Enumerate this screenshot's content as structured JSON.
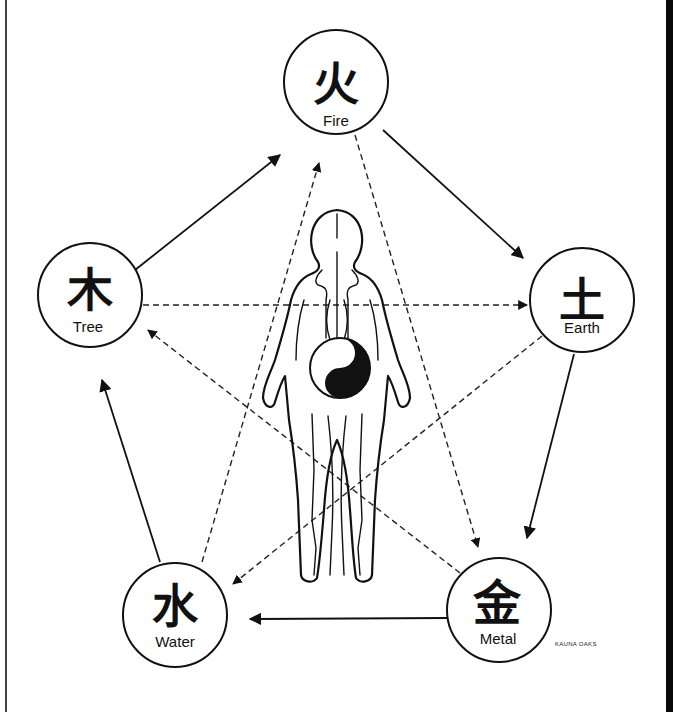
{
  "diagram": {
    "nodes": [
      {
        "id": "fire",
        "glyph": "火",
        "label": "Fire",
        "cx": 336,
        "cy": 82,
        "r": 52
      },
      {
        "id": "earth",
        "glyph": "土",
        "label": "Earth",
        "cx": 582,
        "cy": 300,
        "r": 52
      },
      {
        "id": "metal",
        "glyph": "金",
        "label": "Metal",
        "cx": 499,
        "cy": 610,
        "r": 52
      },
      {
        "id": "water",
        "glyph": "水",
        "label": "Water",
        "cx": 175,
        "cy": 615,
        "r": 52
      },
      {
        "id": "tree",
        "glyph": "木",
        "label": "Tree",
        "cx": 90,
        "cy": 295,
        "r": 52
      }
    ],
    "generating_cycle": [
      {
        "from": "tree",
        "to": "fire",
        "style": "solid"
      },
      {
        "from": "fire",
        "to": "earth",
        "style": "solid"
      },
      {
        "from": "earth",
        "to": "metal",
        "style": "solid"
      },
      {
        "from": "metal",
        "to": "water",
        "style": "solid"
      },
      {
        "from": "water",
        "to": "tree",
        "style": "solid"
      }
    ],
    "controlling_cycle": [
      {
        "from": "tree",
        "to": "earth",
        "style": "dashed"
      },
      {
        "from": "earth",
        "to": "water",
        "style": "dashed"
      },
      {
        "from": "water",
        "to": "fire",
        "style": "dashed"
      },
      {
        "from": "fire",
        "to": "metal",
        "style": "dashed"
      },
      {
        "from": "metal",
        "to": "tree",
        "style": "dashed"
      }
    ],
    "center_figure": "human-body-with-yin-yang",
    "signature": "KAUNA OAKS"
  }
}
